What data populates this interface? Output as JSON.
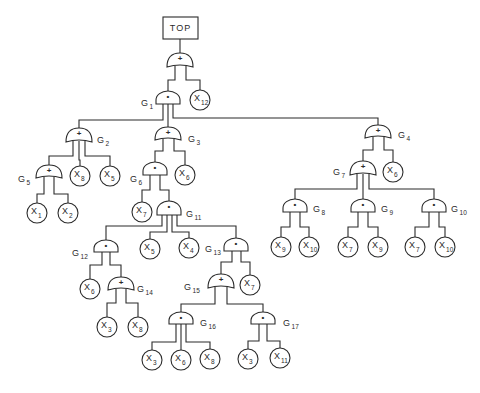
{
  "diagram": {
    "type": "fault-tree",
    "top_event": "TOP",
    "legend": {
      "or_symbol": "+",
      "and_symbol": "•"
    },
    "nodes": [
      {
        "id": "TOP",
        "kind": "box",
        "label": "TOP",
        "x": 180,
        "x1": 163,
        "y1": 17,
        "x2": 198,
        "y2": 39
      },
      {
        "id": "G0",
        "kind": "gate",
        "gate": "or",
        "symbol": "+",
        "x": 180,
        "yt": 53,
        "yb": 67,
        "label": ""
      },
      {
        "id": "G1",
        "kind": "gate",
        "gate": "and",
        "symbol": "•",
        "x": 168,
        "yt": 91,
        "yb": 104,
        "label": "G1",
        "lx": 141,
        "ly": 106
      },
      {
        "id": "X12",
        "kind": "basic",
        "label": "X12",
        "x": 200,
        "y": 100,
        "r": 10
      },
      {
        "id": "G2",
        "kind": "gate",
        "gate": "or",
        "symbol": "+",
        "x": 79,
        "yt": 128,
        "yb": 142,
        "label": "G2",
        "lx": 97,
        "ly": 143
      },
      {
        "id": "G3",
        "kind": "gate",
        "gate": "or",
        "symbol": "+",
        "x": 168,
        "yt": 127,
        "yb": 140,
        "label": "G3",
        "lx": 188,
        "ly": 142
      },
      {
        "id": "G4",
        "kind": "gate",
        "gate": "or",
        "symbol": "+",
        "x": 378,
        "yt": 125,
        "yb": 138,
        "label": "G4",
        "lx": 398,
        "ly": 138
      },
      {
        "id": "G5",
        "kind": "gate",
        "gate": "or",
        "symbol": "+",
        "x": 49,
        "yt": 165,
        "yb": 178,
        "label": "G5",
        "lx": 18,
        "ly": 182
      },
      {
        "id": "X8a",
        "kind": "basic",
        "label": "X8",
        "x": 80,
        "y": 176,
        "r": 10
      },
      {
        "id": "X5a",
        "kind": "basic",
        "label": "X5",
        "x": 110,
        "y": 176,
        "r": 10
      },
      {
        "id": "X1",
        "kind": "basic",
        "label": "X1",
        "x": 37,
        "y": 213,
        "r": 10
      },
      {
        "id": "X2",
        "kind": "basic",
        "label": "X2",
        "x": 68,
        "y": 213,
        "r": 10
      },
      {
        "id": "G6",
        "kind": "gate",
        "gate": "and",
        "symbol": "•",
        "x": 155,
        "yt": 162,
        "yb": 175,
        "label": "G6",
        "lx": 130,
        "ly": 182
      },
      {
        "id": "X6a",
        "kind": "basic",
        "label": "X6",
        "x": 185,
        "y": 175,
        "r": 10
      },
      {
        "id": "X7a",
        "kind": "basic",
        "label": "X7",
        "x": 142,
        "y": 212,
        "r": 10
      },
      {
        "id": "G11",
        "kind": "gate",
        "gate": "and",
        "symbol": "•",
        "x": 169,
        "yt": 201,
        "yb": 215,
        "label": "G11",
        "lx": 186,
        "ly": 217
      },
      {
        "id": "G12",
        "kind": "gate",
        "gate": "and",
        "symbol": "•",
        "x": 106,
        "yt": 240,
        "yb": 252,
        "label": "G12",
        "lx": 72,
        "ly": 256
      },
      {
        "id": "X5b",
        "kind": "basic",
        "label": "X5",
        "x": 150,
        "y": 249,
        "r": 10
      },
      {
        "id": "X4",
        "kind": "basic",
        "label": "X4",
        "x": 189,
        "y": 248,
        "r": 10
      },
      {
        "id": "G13",
        "kind": "gate",
        "gate": "and",
        "symbol": "•",
        "x": 236,
        "yt": 238,
        "yb": 251,
        "label": "G13",
        "lx": 205,
        "ly": 252
      },
      {
        "id": "X6b",
        "kind": "basic",
        "label": "X6",
        "x": 90,
        "y": 289,
        "r": 10
      },
      {
        "id": "G14",
        "kind": "gate",
        "gate": "or",
        "symbol": "+",
        "x": 121,
        "yt": 277,
        "yb": 290,
        "label": "G14",
        "lx": 137,
        "ly": 292
      },
      {
        "id": "X3a",
        "kind": "basic",
        "label": "X3",
        "x": 107,
        "y": 327,
        "r": 10
      },
      {
        "id": "X8b",
        "kind": "basic",
        "label": "X8",
        "x": 138,
        "y": 327,
        "r": 10
      },
      {
        "id": "G15",
        "kind": "gate",
        "gate": "or",
        "symbol": "+",
        "x": 221,
        "yt": 274,
        "yb": 288,
        "label": "G15",
        "lx": 184,
        "ly": 290
      },
      {
        "id": "X7b",
        "kind": "basic",
        "label": "X7",
        "x": 250,
        "y": 285,
        "r": 10
      },
      {
        "id": "G16",
        "kind": "gate",
        "gate": "and",
        "symbol": "•",
        "x": 181,
        "yt": 312,
        "yb": 324,
        "label": "G16",
        "lx": 200,
        "ly": 326
      },
      {
        "id": "G17",
        "kind": "gate",
        "gate": "and",
        "symbol": "•",
        "x": 263,
        "yt": 312,
        "yb": 324,
        "label": "G17",
        "lx": 283,
        "ly": 326
      },
      {
        "id": "X3b",
        "kind": "basic",
        "label": "X3",
        "x": 152,
        "y": 360,
        "r": 10
      },
      {
        "id": "X6c",
        "kind": "basic",
        "label": "X6",
        "x": 181,
        "y": 360,
        "r": 10
      },
      {
        "id": "X8c",
        "kind": "basic",
        "label": "X8",
        "x": 210,
        "y": 359,
        "r": 10
      },
      {
        "id": "X3c",
        "kind": "basic",
        "label": "X3",
        "x": 248,
        "y": 359,
        "r": 10
      },
      {
        "id": "X11",
        "kind": "basic",
        "label": "X11",
        "x": 280,
        "y": 358,
        "r": 10
      },
      {
        "id": "G7",
        "kind": "gate",
        "gate": "or",
        "symbol": "+",
        "x": 363,
        "yt": 161,
        "yb": 175,
        "label": "G7",
        "lx": 333,
        "ly": 175
      },
      {
        "id": "X6d",
        "kind": "basic",
        "label": "X6",
        "x": 393,
        "y": 172,
        "r": 10
      },
      {
        "id": "G8",
        "kind": "gate",
        "gate": "and",
        "symbol": "•",
        "x": 295,
        "yt": 199,
        "yb": 212,
        "label": "G8",
        "lx": 313,
        "ly": 212
      },
      {
        "id": "G9",
        "kind": "gate",
        "gate": "and",
        "symbol": "•",
        "x": 363,
        "yt": 199,
        "yb": 212,
        "label": "G9",
        "lx": 381,
        "ly": 212
      },
      {
        "id": "G10",
        "kind": "gate",
        "gate": "and",
        "symbol": "•",
        "x": 434,
        "yt": 199,
        "yb": 212,
        "label": "G10",
        "lx": 451,
        "ly": 212
      },
      {
        "id": "X9a",
        "kind": "basic",
        "label": "X9",
        "x": 281,
        "y": 247,
        "r": 10
      },
      {
        "id": "X10a",
        "kind": "basic",
        "label": "X10",
        "x": 309,
        "y": 247,
        "r": 10
      },
      {
        "id": "X7c",
        "kind": "basic",
        "label": "X7",
        "x": 348,
        "y": 247,
        "r": 10
      },
      {
        "id": "X9b",
        "kind": "basic",
        "label": "X9",
        "x": 378,
        "y": 247,
        "r": 10
      },
      {
        "id": "X7d",
        "kind": "basic",
        "label": "X7",
        "x": 415,
        "y": 247,
        "r": 10
      },
      {
        "id": "X10b",
        "kind": "basic",
        "label": "X10",
        "x": 445,
        "y": 247,
        "r": 10
      }
    ],
    "edges": [
      {
        "from": "TOP",
        "to": "G0",
        "leg": 0,
        "mid": 46
      },
      {
        "from": "G0",
        "to": "G1",
        "leg": -5,
        "mid": 80
      },
      {
        "from": "G0",
        "to": "X12",
        "leg": 6,
        "mid": 80
      },
      {
        "from": "G1",
        "to": "G2",
        "leg": -5,
        "mid": 120
      },
      {
        "from": "G1",
        "to": "G3",
        "leg": 0,
        "mid": 116
      },
      {
        "from": "G1",
        "to": "G4",
        "leg": 5,
        "mid": 118
      },
      {
        "from": "G2",
        "to": "G5",
        "leg": -6,
        "mid": 156
      },
      {
        "from": "G2",
        "to": "X8a",
        "leg": 0,
        "mid": 160
      },
      {
        "from": "G2",
        "to": "X5a",
        "leg": 6,
        "mid": 156
      },
      {
        "from": "G5",
        "to": "X1",
        "leg": -5,
        "mid": 194
      },
      {
        "from": "G5",
        "to": "X2",
        "leg": 5,
        "mid": 194
      },
      {
        "from": "G3",
        "to": "G6",
        "leg": -5,
        "mid": 151
      },
      {
        "from": "G3",
        "to": "X6a",
        "leg": 6,
        "mid": 151
      },
      {
        "from": "G6",
        "to": "X7a",
        "leg": -5,
        "mid": 190
      },
      {
        "from": "G6",
        "to": "G11",
        "leg": 5,
        "mid": 190
      },
      {
        "from": "G11",
        "to": "G12",
        "leg": -7,
        "mid": 226
      },
      {
        "from": "G11",
        "to": "X5b",
        "leg": -2,
        "mid": 232
      },
      {
        "from": "G11",
        "to": "X4",
        "leg": 3,
        "mid": 232
      },
      {
        "from": "G11",
        "to": "G13",
        "leg": 8,
        "mid": 226
      },
      {
        "from": "G12",
        "to": "X6b",
        "leg": -4,
        "mid": 265
      },
      {
        "from": "G12",
        "to": "G14",
        "leg": 4,
        "mid": 265
      },
      {
        "from": "G14",
        "to": "X3a",
        "leg": -5,
        "mid": 303
      },
      {
        "from": "G14",
        "to": "X8b",
        "leg": 5,
        "mid": 303
      },
      {
        "from": "G13",
        "to": "G15",
        "leg": -4,
        "mid": 262
      },
      {
        "from": "G13",
        "to": "X7b",
        "leg": 5,
        "mid": 262
      },
      {
        "from": "G15",
        "to": "G16",
        "leg": -6,
        "mid": 304
      },
      {
        "from": "G15",
        "to": "G17",
        "leg": 6,
        "mid": 304
      },
      {
        "from": "G16",
        "to": "X3b",
        "leg": -5,
        "mid": 342
      },
      {
        "from": "G16",
        "to": "X6c",
        "leg": 0,
        "mid": 342
      },
      {
        "from": "G16",
        "to": "X8c",
        "leg": 5,
        "mid": 342
      },
      {
        "from": "G17",
        "to": "X3c",
        "leg": -4,
        "mid": 341
      },
      {
        "from": "G17",
        "to": "X11",
        "leg": 4,
        "mid": 341
      },
      {
        "from": "G4",
        "to": "G7",
        "leg": -5,
        "mid": 150
      },
      {
        "from": "G4",
        "to": "X6d",
        "leg": 6,
        "mid": 150
      },
      {
        "from": "G7",
        "to": "G8",
        "leg": -6,
        "mid": 189
      },
      {
        "from": "G7",
        "to": "G9",
        "leg": 0,
        "mid": 189
      },
      {
        "from": "G7",
        "to": "G10",
        "leg": 6,
        "mid": 189
      },
      {
        "from": "G8",
        "to": "X9a",
        "leg": -5,
        "mid": 227
      },
      {
        "from": "G8",
        "to": "X10a",
        "leg": 5,
        "mid": 227
      },
      {
        "from": "G9",
        "to": "X7c",
        "leg": -5,
        "mid": 227
      },
      {
        "from": "G9",
        "to": "X9b",
        "leg": 5,
        "mid": 227
      },
      {
        "from": "G10",
        "to": "X7d",
        "leg": -5,
        "mid": 227
      },
      {
        "from": "G10",
        "to": "X10b",
        "leg": 5,
        "mid": 227
      }
    ]
  }
}
